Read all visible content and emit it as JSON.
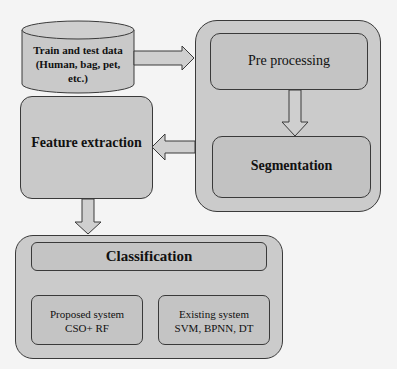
{
  "diagram": {
    "data_source": {
      "label_line1": "Train and test data",
      "label_line2": "(Human, bag, pet,",
      "label_line3": "etc.)",
      "shape": "cylinder"
    },
    "preprocessing_group": {
      "preprocessing": "Pre processing",
      "segmentation": "Segmentation"
    },
    "feature_extraction": "Feature extraction",
    "classification_group": {
      "title": "Classification",
      "proposed": {
        "line1": "Proposed system",
        "line2": "CSO+ RF"
      },
      "existing": {
        "line1": "Existing system",
        "line2": "SVM, BPNN, DT"
      }
    },
    "edges": [
      {
        "from": "data_source",
        "to": "preprocessing_group",
        "direction": "right"
      },
      {
        "from": "preprocessing",
        "to": "segmentation",
        "direction": "down"
      },
      {
        "from": "preprocessing_group",
        "to": "feature_extraction",
        "direction": "left"
      },
      {
        "from": "feature_extraction",
        "to": "classification_group",
        "direction": "down"
      }
    ],
    "colors": {
      "box_fill": "#c9c9c9",
      "border": "#3a3a3a",
      "background": "#f4f4f4"
    }
  }
}
